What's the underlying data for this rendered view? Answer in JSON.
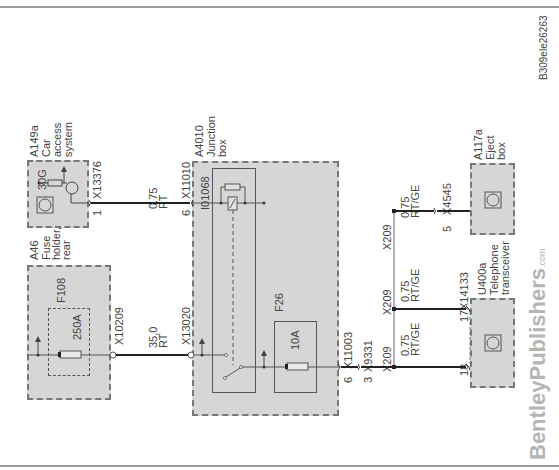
{
  "diagram_id": "B309ele26263",
  "watermark": {
    "brand": "BentleyPublishers",
    "suffix": ".com"
  },
  "components": {
    "a149a": {
      "code": "A149a",
      "name": "Car\naccess\nsystem",
      "terminal": "30G",
      "connector": "X13376",
      "pin": "1"
    },
    "a46": {
      "code": "A46",
      "name": "Fuse\nholder,\nrear",
      "fuse": "F108",
      "fuse_rating": "250A",
      "connector": "X10209"
    },
    "a4010": {
      "code": "A4010",
      "name": "Junction\nbox",
      "relay": "I01068",
      "fuse": "F26",
      "fuse_rating": "10A",
      "connectors": [
        {
          "id": "X11010",
          "pin": "6"
        },
        {
          "id": "X13020",
          "pin": ""
        },
        {
          "id": "X11003",
          "pin": "6"
        }
      ]
    },
    "a117a": {
      "code": "A117a",
      "name": "Eject\nbox",
      "connector": "X4545",
      "pin": "5"
    },
    "u400a": {
      "code": "U400a",
      "name": "Telephone\ntransceiver",
      "connector": "X14133",
      "pins": [
        "17",
        "18"
      ]
    }
  },
  "wires": [
    {
      "label": "0.75\nRT",
      "from": "X13376",
      "to": "X11010"
    },
    {
      "label": "35,0\nRT",
      "from": "X10209",
      "to": "X13020"
    },
    {
      "label": "0.75\nRT/GE",
      "from": "X209",
      "to": "X4545"
    },
    {
      "label": "0.75\nRT/GE",
      "from": "X209",
      "to": "X14133-17"
    },
    {
      "label": "0.75\nRT/GE",
      "from": "X209",
      "to": "X14133-18"
    }
  ],
  "connectors": {
    "x9331": {
      "id": "X9331",
      "pin": "3"
    },
    "splices": [
      "X209",
      "X209",
      "X209"
    ]
  }
}
